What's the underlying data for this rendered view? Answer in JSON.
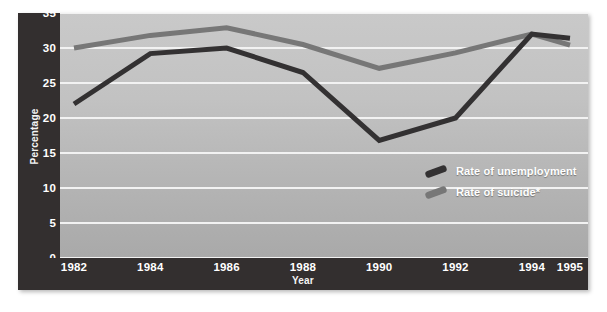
{
  "figure": {
    "clipped_title_fragment": "",
    "background_color": "#b8b8b8",
    "axis_panel_color": "#332f2f",
    "gridline_color": "#f2f2f2"
  },
  "legend": {
    "position": "inside-bottom-right",
    "entries": [
      {
        "label": "Rate of unemployment",
        "color": "#333132"
      },
      {
        "label": "Rate of suicide*",
        "color": "#777777"
      }
    ]
  },
  "chart_data": {
    "type": "line",
    "title": "",
    "xlabel": "Year",
    "ylabel": "Percentage",
    "x": [
      1982,
      1984,
      1986,
      1988,
      1990,
      1992,
      1994,
      1995
    ],
    "categories": [
      "1982",
      "1984",
      "1986",
      "1988",
      "1990",
      "1992",
      "1994",
      "1995"
    ],
    "xlim": [
      1982,
      1995
    ],
    "ylim": [
      0,
      35
    ],
    "yticks": [
      0,
      5,
      10,
      15,
      20,
      25,
      30,
      35
    ],
    "ytick_labels": [
      "0",
      "5",
      "10",
      "15",
      "20",
      "25",
      "30",
      "35"
    ],
    "grid": "horizontal",
    "series": [
      {
        "name": "Rate of unemployment",
        "color": "#333132",
        "values": [
          22.0,
          29.2,
          30.0,
          26.5,
          16.8,
          20.0,
          32.0,
          31.4
        ]
      },
      {
        "name": "Rate of suicide*",
        "color": "#777777",
        "values": [
          30.0,
          31.8,
          32.9,
          30.5,
          27.1,
          29.3,
          32.0,
          30.4
        ]
      }
    ],
    "footnote_marker": "*"
  }
}
